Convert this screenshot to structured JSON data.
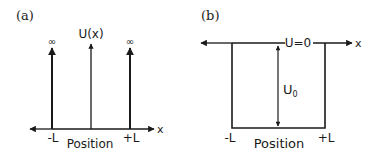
{
  "panels": [
    {
      "label": "(a)",
      "title": "Infinite square well",
      "y_axis_label": "U(x)",
      "x_axis_label": "x",
      "position_label": "Position",
      "left_wall_label": "-L",
      "right_wall_label": "+L",
      "left_wall_value": "∞",
      "right_wall_value": "∞"
    },
    {
      "label": "(b)",
      "title": "Finite square well",
      "zero_label": "U=0",
      "x_axis_label": "x",
      "depth_label": "U",
      "depth_subscript": "0",
      "position_label": "Position",
      "left_wall_label": "-L",
      "right_wall_label": "+L"
    }
  ],
  "colors": {
    "stroke": "#1a1a1a",
    "background": "#ffffff"
  }
}
